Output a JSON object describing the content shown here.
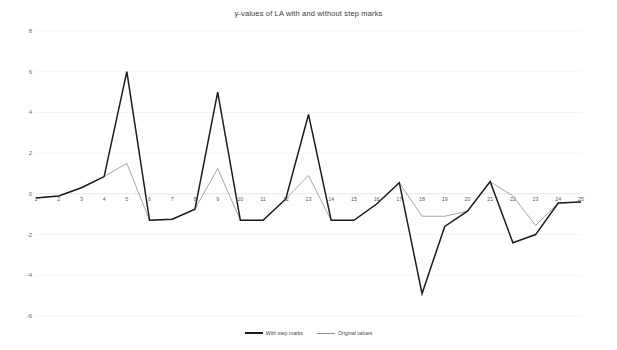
{
  "chart_data": {
    "type": "line",
    "title": "y-values of LA with and without step marks",
    "xlabel": "",
    "ylabel": "",
    "grid": true,
    "legend_position": "bottom",
    "xlim": [
      1,
      25
    ],
    "ylim": [
      -6,
      8
    ],
    "yticks": [
      8,
      6,
      4,
      2,
      0,
      -2,
      -4,
      -6
    ],
    "ytick_labels": [
      "8",
      "6",
      "4",
      "2",
      "0",
      "-2",
      "-4",
      "-6"
    ],
    "x": [
      1,
      2,
      3,
      4,
      5,
      6,
      7,
      8,
      9,
      10,
      11,
      12,
      13,
      14,
      15,
      16,
      17,
      18,
      19,
      20,
      21,
      22,
      23,
      24,
      25
    ],
    "xtick_labels": [
      "1",
      "2",
      "3",
      "4",
      "5",
      "6",
      "7",
      "8",
      "9",
      "10",
      "11",
      "12",
      "13",
      "14",
      "15",
      "16",
      "17",
      "18",
      "19",
      "20",
      "21",
      "22",
      "23",
      "24",
      "25"
    ],
    "series": [
      {
        "name": "With step marks",
        "color": "#1c1c1c",
        "width": 1.5,
        "values": [
          -0.2,
          -0.1,
          0.3,
          0.85,
          6.0,
          -1.3,
          -1.25,
          -0.75,
          5.0,
          -1.3,
          -1.3,
          -0.25,
          3.9,
          -1.3,
          -1.3,
          -0.5,
          0.55,
          -4.9,
          -1.6,
          -0.85,
          0.6,
          -2.4,
          -2.0,
          -0.45,
          -0.4
        ]
      },
      {
        "name": "Original values",
        "color": "#8f8f8f",
        "width": 0.8,
        "values": [
          -0.2,
          -0.1,
          0.3,
          0.85,
          1.5,
          -1.3,
          -1.25,
          -0.75,
          1.25,
          -1.3,
          -1.3,
          -0.25,
          0.9,
          -1.3,
          -1.3,
          -0.5,
          0.55,
          -1.1,
          -1.1,
          -0.85,
          0.6,
          -0.1,
          -1.55,
          -0.45,
          -0.4
        ]
      }
    ]
  },
  "legend": {
    "items": [
      {
        "label": "With step marks"
      },
      {
        "label": "Original values"
      }
    ]
  }
}
